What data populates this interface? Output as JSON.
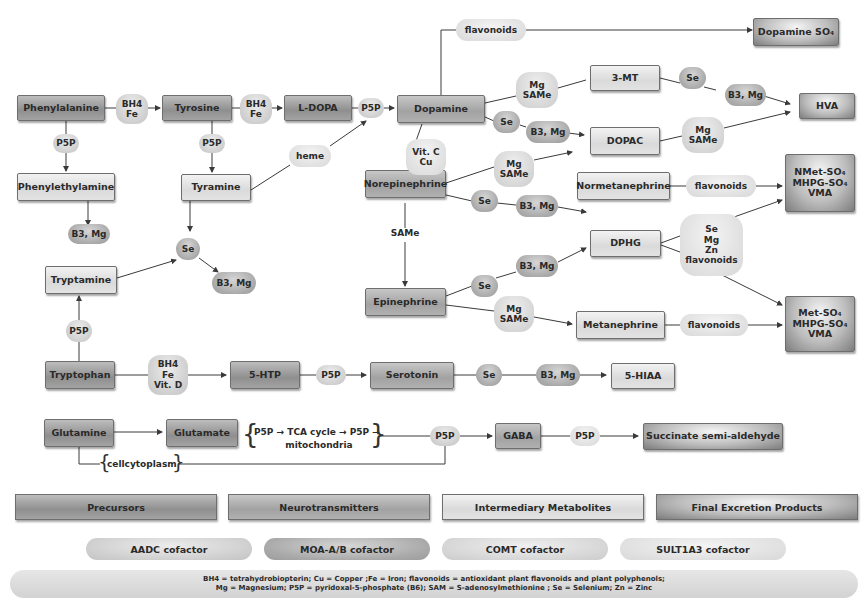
{
  "nodes": {
    "phenylalanine": "Phenylalanine",
    "tyrosine": "Tyrosine",
    "ldopa": "L-DOPA",
    "dopamine": "Dopamine",
    "phenylethylamine": "Phenylethylamine",
    "tyramine": "Tyramine",
    "tryptamine": "Tryptamine",
    "tryptophan": "Tryptophan",
    "five_htp": "5-HTP",
    "serotonin": "Serotonin",
    "five_hiaa": "5-HIAA",
    "glutamine": "Glutamine",
    "glutamate": "Glutamate",
    "gaba": "GABA",
    "succinate": "Succinate semi-aldehyde",
    "dopamine_so4": "Dopamine SO₄",
    "three_mt": "3-MT",
    "hva": "HVA",
    "dopac": "DOPAC",
    "norepinephrine": "Norepinephrine",
    "normetanephrine": "Normetanephrine",
    "dphg": "DPHG",
    "epinephrine": "Epinephrine",
    "metanephrine": "Metanephrine",
    "nmet_products": "NMet-SO₄\nMHPG-SO₄\nVMA",
    "met_products": "Met-SO₄\nMHPG-SO₄\nVMA"
  },
  "cofactors": {
    "phe_tyr": "BH4\nFe",
    "tyr_ldopa": "BH4\nFe",
    "ldopa_dopa": "P5P",
    "phe_pea": "P5P",
    "tyr_tyramine": "P5P",
    "pea_b3mg": "B3, Mg",
    "heme": "heme",
    "flavonoids_top": "flavonoids",
    "dopa_mg_same": "Mg\nSAMe",
    "dopa_se": "Se",
    "dopa_b3mg": "B3, Mg",
    "mt_se": "Se",
    "mt_b3mg": "B3, Mg",
    "dopac_mg_same": "Mg\nSAMe",
    "vitc_cu": "Vit. C\nCu",
    "ne_mg_same": "Mg\nSAMe",
    "ne_se": "Se",
    "ne_b3mg": "B3, Mg",
    "same_label": "SAMe",
    "epi_se": "Se",
    "epi_b3mg": "B3, Mg",
    "epi_mg_same": "Mg\nSAMe",
    "nmn_flavonoids": "flavonoids",
    "dphg_group": "Se\nMg\nZn\nflavonoids",
    "mn_flavonoids": "flavonoids",
    "amine_se": "Se",
    "amine_b3mg": "B3, Mg",
    "trp_p5p": "P5P",
    "trp_htp": "BH4\nFe\nVit. D",
    "htp_p5p": "P5P",
    "ser_se": "Se",
    "ser_b3mg": "B3, Mg",
    "gaba_p5p_in": "P5P",
    "gaba_p5p_out": "P5P"
  },
  "annotations": {
    "tca_line1": "P5P → TCA cycle → P5P →",
    "tca_line2": "mitochondria",
    "cytoplasm": "cellcytoplasm"
  },
  "legend": {
    "categories": [
      {
        "label": "Precursors"
      },
      {
        "label": "Neurotransmitters"
      },
      {
        "label": "Intermediary Metabolites"
      },
      {
        "label": "Final Excretion Products"
      }
    ],
    "cofactor_types": [
      {
        "label": "AADC cofactor"
      },
      {
        "label": "MOA-A/B cofactor"
      },
      {
        "label": "COMT cofactor"
      },
      {
        "label": "SULT1A3 cofactor"
      }
    ],
    "abbreviations_line1": "BH4 = tetrahydrobiopterin; Cu = Copper ;Fe = Iron; flavonoids = antioxidant plant flavonoids and plant polyphenols;",
    "abbreviations_line2": "Mg = Magnesium; P5P = pyridoxal-5-phosphate (B6); SAM = S-adenosylmethionine ; Se = Selenium; Zn = Zinc"
  },
  "colors": {
    "precursor": "#9a9a9a",
    "neurotransmitter": "#ababab",
    "intermediary": "#e0e0e0",
    "final": "#8a8a8a",
    "line": "#3a3a3a"
  }
}
